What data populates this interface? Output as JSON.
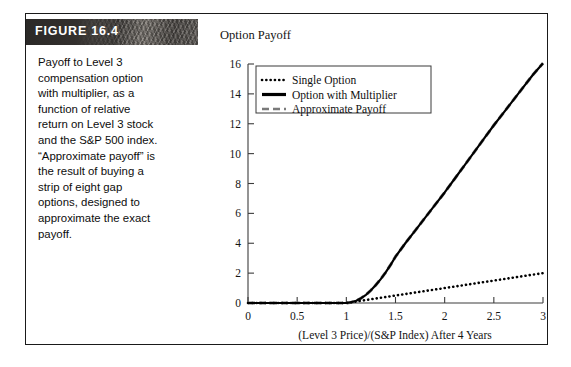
{
  "figure": {
    "label": "FIGURE 16.4",
    "caption": "Payoff to Level 3\ncompensation option\nwith multiplier, as a\nfunction of relative\nreturn on Level 3 stock\nand the S&P 500 index.\n“Approximate payoff” is\nthe result of buying a\nstrip of eight gap\noptions, designed to\napproximate the exact\npayoff."
  },
  "chart_data": {
    "type": "line",
    "title": "Option Payoff",
    "xlabel": "(Level 3 Price)/(S&P Index) After 4 Years",
    "ylabel": "Option Payoff",
    "xlim": [
      0,
      3
    ],
    "ylim": [
      0,
      16
    ],
    "xticks": [
      "0",
      "0.5",
      "1",
      "1.5",
      "2",
      "2.5",
      "3"
    ],
    "xtick_values": [
      0,
      0.5,
      1,
      1.5,
      2,
      2.5,
      3
    ],
    "yticks": [
      "0",
      "2",
      "4",
      "6",
      "8",
      "10",
      "12",
      "14",
      "16"
    ],
    "ytick_values": [
      0,
      2,
      4,
      6,
      8,
      10,
      12,
      14,
      16
    ],
    "grid": false,
    "legend_position": "top-left",
    "series": [
      {
        "name": "Single Option",
        "style": "dotted",
        "color": "#000000",
        "x": [
          0,
          0.25,
          0.5,
          0.75,
          1,
          1.25,
          1.5,
          1.75,
          2,
          2.25,
          2.5,
          2.75,
          3
        ],
        "y": [
          0,
          0,
          0,
          0,
          0,
          0.25,
          0.5,
          0.75,
          1,
          1.25,
          1.5,
          1.75,
          2
        ]
      },
      {
        "name": "Option with Multiplier",
        "style": "solid",
        "color": "#000000",
        "x": [
          0,
          0.25,
          0.5,
          0.75,
          1.0,
          1.05,
          1.1,
          1.15,
          1.2,
          1.25,
          1.3,
          1.35,
          1.4,
          1.45,
          1.5,
          1.6,
          1.7,
          1.8,
          1.9,
          2.0,
          2.1,
          2.2,
          2.3,
          2.4,
          2.5,
          2.6,
          2.7,
          2.8,
          2.9,
          3.0
        ],
        "y": [
          0,
          0,
          0,
          0,
          0,
          0.05,
          0.15,
          0.32,
          0.55,
          0.85,
          1.2,
          1.6,
          2.05,
          2.55,
          3.1,
          4.0,
          4.85,
          5.7,
          6.55,
          7.4,
          8.3,
          9.2,
          10.1,
          11.0,
          11.9,
          12.75,
          13.6,
          14.45,
          15.3,
          16.05
        ]
      },
      {
        "name": "Approximate Payoff",
        "style": "dashed",
        "color": "#6f6f6f",
        "x": [
          0,
          0.25,
          0.5,
          0.75,
          1.0,
          1.05,
          1.1,
          1.15,
          1.2,
          1.25,
          1.3,
          1.35,
          1.4,
          1.45,
          1.5,
          1.6,
          1.7,
          1.8,
          1.9,
          2.0,
          2.1,
          2.2,
          2.3,
          2.4,
          2.5,
          2.6,
          2.7,
          2.8,
          2.9,
          3.0
        ],
        "y": [
          0,
          0,
          0,
          0,
          0,
          0.05,
          0.15,
          0.32,
          0.55,
          0.85,
          1.2,
          1.6,
          2.05,
          2.55,
          3.1,
          4.0,
          4.85,
          5.7,
          6.55,
          7.4,
          8.3,
          9.2,
          10.1,
          11.0,
          11.9,
          12.75,
          13.6,
          14.45,
          15.3,
          16.05
        ]
      }
    ],
    "legend": [
      {
        "label": "Single Option",
        "style": "dotted"
      },
      {
        "label": "Option with Multiplier",
        "style": "solid"
      },
      {
        "label": "Approximate Payoff",
        "style": "dashed"
      }
    ]
  }
}
